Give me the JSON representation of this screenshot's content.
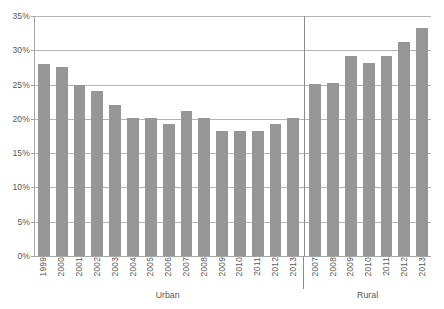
{
  "chart_data": {
    "type": "bar",
    "title": "",
    "subtitle": "",
    "xlabel": "",
    "ylabel": "",
    "ylim": [
      0,
      35
    ],
    "ytick_values": [
      0,
      5,
      10,
      15,
      20,
      25,
      30,
      35
    ],
    "ytick_labels": [
      "0%",
      "5%",
      "10%",
      "15%",
      "20%",
      "25%",
      "30%",
      "35%"
    ],
    "grid": true,
    "legend": "none",
    "value_suffix": "%",
    "groups": [
      {
        "name": "Urban",
        "categories": [
          "1999",
          "2000",
          "2001",
          "2002",
          "2003",
          "2004",
          "2005",
          "2006",
          "2007",
          "2008",
          "2009",
          "2010",
          "2011",
          "2012",
          "2013"
        ],
        "values": [
          28.0,
          27.5,
          24.9,
          24.1,
          22.0,
          20.1,
          20.1,
          19.2,
          21.1,
          20.1,
          18.3,
          18.3,
          18.3,
          19.2,
          20.1
        ]
      },
      {
        "name": "Rural",
        "categories": [
          "2007",
          "2008",
          "2009",
          "2010",
          "2011",
          "2012",
          "2013"
        ],
        "values": [
          25.1,
          25.2,
          29.2,
          28.2,
          29.2,
          31.2,
          33.2
        ]
      }
    ],
    "categories": [
      "1999",
      "2000",
      "2001",
      "2002",
      "2003",
      "2004",
      "2005",
      "2006",
      "2007",
      "2008",
      "2009",
      "2010",
      "2011",
      "2012",
      "2013",
      "2007",
      "2008",
      "2009",
      "2010",
      "2011",
      "2012",
      "2013"
    ],
    "values": [
      28.0,
      27.5,
      24.9,
      24.1,
      22.0,
      20.1,
      20.1,
      19.2,
      21.1,
      20.1,
      18.3,
      18.3,
      18.3,
      19.2,
      20.1,
      25.1,
      25.2,
      29.2,
      28.2,
      29.2,
      31.2,
      33.2
    ],
    "colors": {
      "bar": "#969696",
      "gridline": "#b5b5b5",
      "axis": "#a6a6a6",
      "text": "#595959",
      "background": "#ffffff"
    }
  }
}
